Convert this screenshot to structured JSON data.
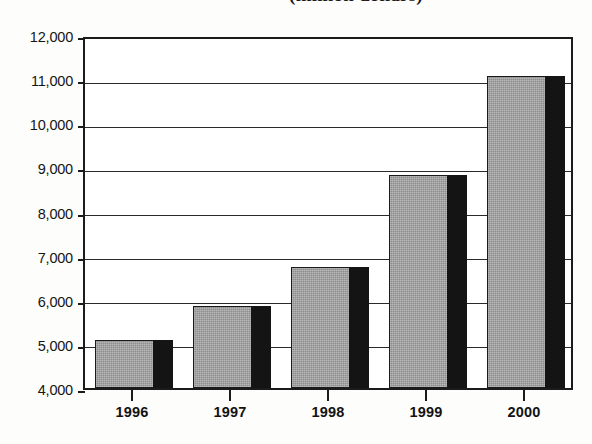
{
  "chart_data": {
    "type": "bar",
    "title": "(million dollars)",
    "xlabel": "",
    "ylabel": "",
    "categories": [
      "1996",
      "1997",
      "1998",
      "1999",
      "2000"
    ],
    "values": [
      5080,
      5870,
      6750,
      8830,
      11080
    ],
    "ylim": [
      4000,
      12000
    ],
    "ytick_labels": [
      "12,000",
      "11,000",
      "10,000",
      "9,000",
      "8,000",
      "7,000",
      "6,000",
      "5,000",
      "4,000"
    ],
    "ytick_values": [
      12000,
      11000,
      10000,
      9000,
      8000,
      7000,
      6000,
      5000,
      4000
    ],
    "grid": true,
    "legend": "none",
    "style": {
      "bar_face_color": "#8d8d8d",
      "bar_shadow_color": "#141414",
      "axis_color": "#1b1b1b",
      "background": "#ffffff"
    }
  }
}
